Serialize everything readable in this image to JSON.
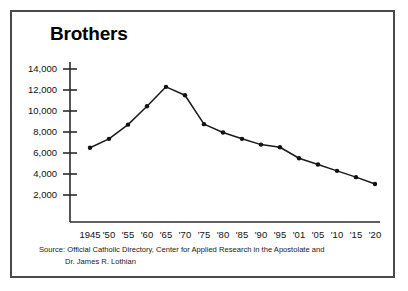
{
  "chart_data": {
    "type": "line",
    "title": "Brothers",
    "xlabel": "",
    "ylabel": "",
    "grid": false,
    "legend": "none",
    "categories": [
      "1945",
      "'50",
      "'55",
      "'60",
      "'65",
      "'70",
      "'75",
      "'80",
      "'85",
      "'90",
      "'95",
      "'01",
      "'05",
      "'10",
      "'15",
      "'20"
    ],
    "values": [
      6500,
      7350,
      8700,
      10450,
      12300,
      11500,
      8750,
      7950,
      7350,
      6800,
      6550,
      5500,
      4900,
      4300,
      3700,
      3050
    ],
    "ylim": [
      0,
      15000
    ],
    "ytick_values": [
      14000,
      12000,
      10000,
      8000,
      6000,
      4000,
      2000
    ],
    "ytick_labels": [
      "14,000",
      "12,000",
      "10,000",
      "8,000",
      "6,000",
      "4,000",
      "2,000"
    ],
    "marker": "filled-circle",
    "line_color": "#1a1a1a",
    "marker_color": "#111111"
  },
  "source": {
    "line1": "Source: Official Catholic Directory, Center for Applied Research in the Apostolate and",
    "line2": "Dr. James R. Lothian"
  },
  "colors": {
    "frame": "#4a4a4a",
    "background": "#ffffff",
    "axis": "#2b2b2b",
    "text": "#111111"
  }
}
